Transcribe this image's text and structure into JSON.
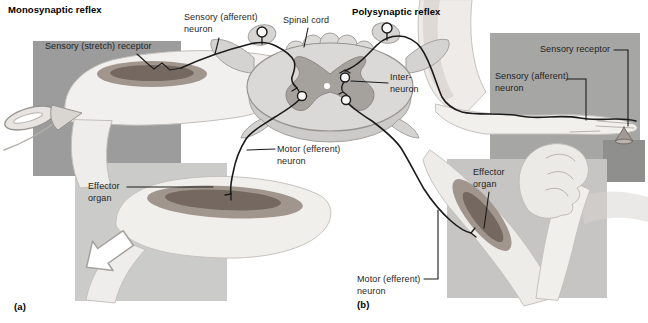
{
  "figure": {
    "panel_a": {
      "title": "Monosynaptic reflex",
      "tag": "(a)",
      "labels": {
        "stretch_receptor": "Sensory (stretch) receptor",
        "sensory_afferent_line1": "Sensory (afferent)",
        "sensory_afferent_line2": "neuron",
        "motor_efferent_line1": "Motor (efferent)",
        "motor_efferent_line2": "neuron",
        "effector_line1": "Effector",
        "effector_line2": "organ"
      }
    },
    "panel_b": {
      "title": "Polysynaptic reflex",
      "tag": "(b)",
      "labels": {
        "sensory_receptor": "Sensory receptor",
        "sensory_afferent_line1": "Sensory (afferent)",
        "sensory_afferent_line2": "neuron",
        "interneuron_line1": "Inter-",
        "interneuron_line2": "neuron",
        "motor_efferent_line1": "Motor (efferent)",
        "motor_efferent_line2": "neuron",
        "effector_line1": "Effector",
        "effector_line2": "organ"
      }
    },
    "shared_labels": {
      "spinal_cord": "Spinal cord"
    },
    "colors": {
      "page_background": "#ffffff",
      "panel_a_square": "#9c9c9c",
      "panel_a_lower_square": "#cbcbca",
      "panel_b_square": "#a6a6a5",
      "panel_b_corner_square": "#8f8f8e",
      "panel_b_lower_square": "#c6c5c4",
      "neuron_line": "#1b1b1b",
      "spinal_cord_fill": "#dad9d7",
      "gray_matter_fill": "#a5a29e",
      "muscle_dark": "#746860",
      "muscle_mid": "#a1968e"
    }
  }
}
